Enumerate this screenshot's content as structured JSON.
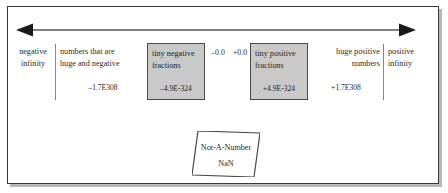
{
  "figure": {
    "colors": {
      "frame_border": "#3b3b3b",
      "frame_shadow": "#b9b9b9",
      "axis_line": "#555555",
      "divider": "#8a8a8a",
      "box_fill": "#c9c9c9",
      "box_border": "#4a4a4a",
      "text": "#2b2b2b",
      "background": "#ffffff"
    }
  },
  "axis": {
    "icon_left": "arrow-left-head",
    "icon_right": "arrow-right-head",
    "style": "double-headed-horizontal-arrow"
  },
  "regions": {
    "negative_infinity": {
      "line1": "negative",
      "line2": "infinity"
    },
    "huge_and_negative": {
      "line1": "numbers that are",
      "line2": "huge and negative",
      "value": "–1.7E308"
    },
    "tiny_negative_fractions": {
      "line1": "tiny negative",
      "line2": "fractions",
      "value": "–4.9E-324"
    },
    "negative_zero": {
      "label": "–0.0"
    },
    "positive_zero": {
      "label": "+0.0"
    },
    "tiny_positive_fractions": {
      "line1": "tiny positive",
      "line2": "fractions",
      "value": "+4.9E-324"
    },
    "huge_and_positive": {
      "line1": "huge positive",
      "line2": "numbers",
      "value": "+1.7E308"
    },
    "positive_infinity": {
      "line1": "positive",
      "line2": "infinity"
    },
    "not_a_number": {
      "title": "Not-A-Number",
      "abbreviation": "NaN"
    }
  }
}
